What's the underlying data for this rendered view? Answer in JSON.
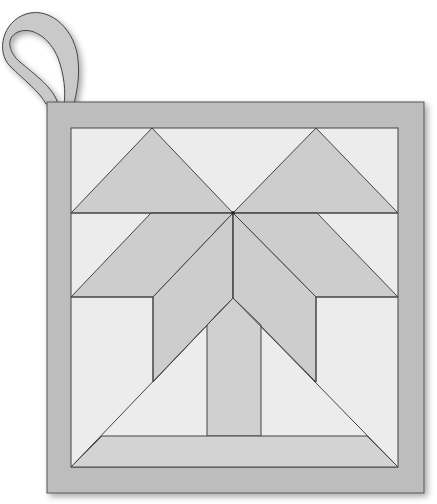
{
  "title": "Potholder quilt block",
  "colors": {
    "background": "#ffffff",
    "frame": "#bdbdbd",
    "panel_light": "#ececec",
    "piece_mid": "#cdcdcd",
    "trunk": "#d0d0d0",
    "strip": "#d3d3d3",
    "loop": "#c9c9c9",
    "stroke": "#444444"
  },
  "shapes": {
    "frame": {
      "x": 47,
      "y": 102,
      "w": 377,
      "h": 391
    },
    "panel": {
      "x": 71,
      "y": 128,
      "w": 327,
      "h": 339
    },
    "triangle_top_left": "152,128 233,213 71,213",
    "triangle_top_right": "316,128 398,213 233,213",
    "parallelogram_left": "151,213 233,213 153,297 71,297",
    "parallelogram_right": "233,213 317,213 398,297 316,297",
    "petal_left": "233,213 233,298 153,382 153,297",
    "petal_right": "233,213 316,297 316,382 233,298",
    "trunk": "233,298 261,325 261,436 207,436 207,325",
    "bottom_strip": "102,436 367,436 398,467 71,467",
    "lines": [
      "71,213 398,213",
      "71,297 153,297",
      "316,297 398,297",
      "71,467 233,298",
      "233,298 398,467",
      "233,213 233,298",
      "153,297 153,382",
      "316,297 316,382"
    ]
  }
}
